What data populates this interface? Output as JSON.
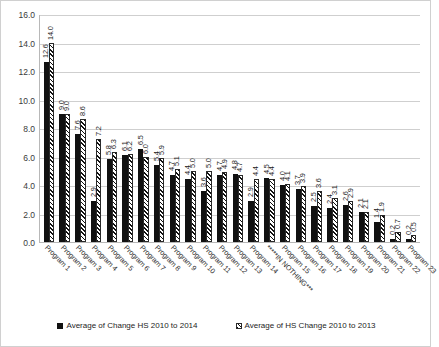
{
  "chart_data": {
    "type": "bar",
    "title": "",
    "xlabel": "",
    "ylabel": "",
    "ylim": [
      0.0,
      16.0
    ],
    "ytick_step": 2.0,
    "ytick_labels": [
      "0.0",
      "2.0",
      "4.0",
      "6.0",
      "8.0",
      "10.0",
      "12.0",
      "14.0",
      "16.0"
    ],
    "grid": true,
    "legend_position": "bottom",
    "categories": [
      "Program 1",
      "Program 2",
      "Program 3",
      "Program 4",
      "Program 5",
      "Program 6",
      "Program 7",
      "Program 8",
      "Program 9",
      "Program 10",
      "Program 11",
      "Program 12",
      "Program 13",
      "Program 14",
      "*****IN NOTHING***",
      "Program 15",
      "Program 16",
      "Program 17",
      "Program 18",
      "Program 19",
      "Program 20",
      "Program 21",
      "Program 22",
      "Program 23"
    ],
    "series": [
      {
        "name": "Average of Change HS 2010 to 2014",
        "style": "solid",
        "color": "#111111",
        "values": [
          12.6,
          9.0,
          7.6,
          2.9,
          5.8,
          6.1,
          6.5,
          5.4,
          4.7,
          4.4,
          3.6,
          4.7,
          4.8,
          2.9,
          4.5,
          4.0,
          3.7,
          2.5,
          2.4,
          2.6,
          2.1,
          1.4,
          0.2,
          0.2
        ]
      },
      {
        "name": "Average of HS Change 2010 to 2013",
        "style": "hatched",
        "color": "#111111",
        "values": [
          14.0,
          9.0,
          8.6,
          7.2,
          6.3,
          6.2,
          6.0,
          5.9,
          5.1,
          5.0,
          5.0,
          4.9,
          4.7,
          4.4,
          4.4,
          4.1,
          3.9,
          3.6,
          3.1,
          2.9,
          2.1,
          1.9,
          0.7,
          0.5
        ]
      }
    ],
    "labels_series1": [
      "12.6",
      "9.0",
      "7.6",
      "2.9",
      "5.8",
      "6.1",
      "6.5",
      "5.4",
      "4.7",
      "4.4",
      "3.6",
      "4.7",
      "4.8",
      "2.9",
      "4.5",
      "4.0",
      "3.7",
      "2.5",
      "2.4",
      "2.6",
      "2.1",
      "1.4",
      "0.2",
      "0.2"
    ],
    "labels_series2": [
      "14.0",
      "9.0",
      "8.6",
      "7.2",
      "6.3",
      "6.2",
      "6.0",
      "5.9",
      "5.1",
      "5.0",
      "5.0",
      "4.9",
      "4.7",
      "4.4",
      "4.4",
      "4.1",
      "3.9",
      "3.6",
      "3.1",
      "2.9",
      "2.1",
      "1.9",
      "0.7",
      "0.5"
    ]
  },
  "legend": {
    "items": [
      {
        "label": "Average of Change HS 2010 to 2014",
        "style": "solid"
      },
      {
        "label": "Average of HS Change 2010 to 2013",
        "style": "hatch"
      }
    ]
  }
}
